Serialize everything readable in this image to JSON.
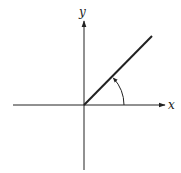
{
  "diagram": {
    "type": "coordinate-axes-with-angle",
    "axes": {
      "x_label": "x",
      "y_label": "y"
    },
    "origin": [
      84,
      105
    ],
    "ray": {
      "from": [
        84,
        105
      ],
      "to": [
        152,
        36
      ]
    },
    "angle_arc": {
      "radius": 40,
      "from_deg": 0,
      "to_deg": 45,
      "direction": "counterclockwise"
    },
    "colors": {
      "stroke": "#222222",
      "background": "#ffffff"
    }
  }
}
